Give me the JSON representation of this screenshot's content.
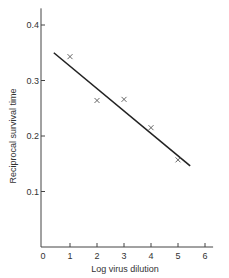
{
  "chart_data": {
    "type": "scatter",
    "title": "",
    "xlabel": "Log virus dilution",
    "ylabel": "Reciprocal survival time",
    "xlim": [
      0,
      6.3
    ],
    "ylim": [
      0,
      0.43
    ],
    "xticks": [
      0,
      1,
      2,
      3,
      4,
      5,
      6
    ],
    "xtick_labels": [
      "0",
      "1",
      "2",
      "3",
      "4",
      "5",
      "6"
    ],
    "yticks": [
      0.1,
      0.2,
      0.3,
      0.4
    ],
    "ytick_labels": [
      "0.1",
      "0.2",
      "0.3",
      "0.4"
    ],
    "grid": false,
    "series": [
      {
        "name": "observed",
        "marker": "x",
        "x": [
          1,
          2,
          3,
          4,
          5
        ],
        "y": [
          0.343,
          0.264,
          0.266,
          0.215,
          0.157
        ]
      }
    ],
    "fit_line": {
      "name": "regression line",
      "x": [
        0.4,
        5.45
      ],
      "y": [
        0.35,
        0.146
      ]
    }
  }
}
